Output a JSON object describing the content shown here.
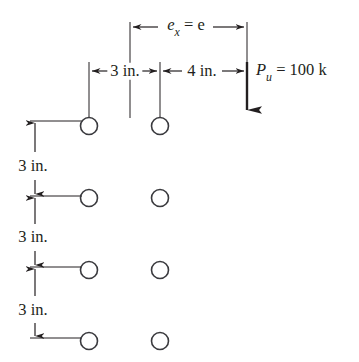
{
  "figure": {
    "type": "bolt-group-eccentric-load-diagram",
    "background_color": "#ffffff",
    "ink_color": "#231f20"
  },
  "horizontal_dimensions": {
    "eccentricity": {
      "symbol": "e",
      "subscript": "x",
      "equals": "=",
      "value_symbol": "e",
      "full_label": "ex = e",
      "from_x_px": 130,
      "to_x_px": 247,
      "line_y_px": 27
    },
    "segments": [
      {
        "label": "3 in.",
        "value": 3,
        "unit": "in.",
        "from_x_px": 89,
        "to_x_px": 160,
        "line_y_px": 71
      },
      {
        "label": "4 in.",
        "value": 4,
        "unit": "in.",
        "from_x_px": 160,
        "to_x_px": 247,
        "line_y_px": 71
      }
    ]
  },
  "vertical_dimensions": {
    "line_x_px": 35,
    "segments": [
      {
        "label": "3 in.",
        "value": 3,
        "unit": "in.",
        "from_y_px": 121,
        "to_y_px": 196,
        "label_y_px": 166
      },
      {
        "label": "3 in.",
        "value": 3,
        "unit": "in.",
        "from_y_px": 196,
        "to_y_px": 267,
        "label_y_px": 237
      },
      {
        "label": "3 in.",
        "value": 3,
        "unit": "in.",
        "from_y_px": 267,
        "to_y_px": 338,
        "label_y_px": 310
      }
    ]
  },
  "load": {
    "symbol": "P",
    "subscript": "u",
    "equals": "=",
    "magnitude": "100",
    "unit": "k",
    "full_label": "Pu = 100 k",
    "label_x_px": 256,
    "label_y_px": 72,
    "arrow_x_px": 247,
    "arrow_from_y_px": 22,
    "arrow_to_y_px": 113,
    "direction": "down"
  },
  "bolts": {
    "diameter_px": 17,
    "columns_x_px": [
      89,
      160
    ],
    "rows_y_px": [
      126,
      198,
      270,
      341
    ],
    "count": 8,
    "items": [
      {
        "col": 0,
        "row": 0,
        "cx": 89,
        "cy": 126
      },
      {
        "col": 1,
        "row": 0,
        "cx": 160,
        "cy": 126
      },
      {
        "col": 0,
        "row": 1,
        "cx": 89,
        "cy": 198
      },
      {
        "col": 1,
        "row": 1,
        "cx": 160,
        "cy": 198
      },
      {
        "col": 0,
        "row": 2,
        "cx": 89,
        "cy": 270
      },
      {
        "col": 1,
        "row": 2,
        "cx": 160,
        "cy": 270
      },
      {
        "col": 0,
        "row": 3,
        "cx": 89,
        "cy": 341
      },
      {
        "col": 1,
        "row": 3,
        "cx": 160,
        "cy": 341
      }
    ]
  },
  "labels": {
    "ecc_e": "e",
    "ecc_sub": "x",
    "ecc_eq": "= e",
    "seg_3in": "3 in.",
    "seg_4in": "4 in.",
    "vert_3in_a": "3 in.",
    "vert_3in_b": "3 in.",
    "vert_3in_c": "3 in.",
    "load_p": "P",
    "load_sub": "u",
    "load_rest": "= 100 k"
  }
}
